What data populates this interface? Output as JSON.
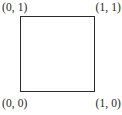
{
  "figure": {
    "type": "unit-square-diagram",
    "background_color": "#ffffff",
    "shape": {
      "name": "unit square",
      "stroke_color": "#2b2b2b",
      "fill_color": "#ffffff",
      "stroke_width_px": 1.5
    },
    "labels": {
      "top_left": "(0, 1)",
      "top_right": "(1, 1)",
      "bottom_left": "(0, 0)",
      "bottom_right": "(1, 0)"
    },
    "label_color": "#262626"
  },
  "chart_data": {
    "type": "scatter",
    "title": "",
    "xlabel": "",
    "ylabel": "",
    "xlim": [
      0,
      1
    ],
    "ylim": [
      0,
      1
    ],
    "grid": false,
    "legend": "none",
    "annotations": [
      {
        "text": "(0, 1)",
        "x": 0,
        "y": 1,
        "position": "above-left"
      },
      {
        "text": "(1, 1)",
        "x": 1,
        "y": 1,
        "position": "above-right"
      },
      {
        "text": "(0, 0)",
        "x": 0,
        "y": 0,
        "position": "below-left"
      },
      {
        "text": "(1, 0)",
        "x": 1,
        "y": 0,
        "position": "below-right"
      }
    ],
    "series": [
      {
        "name": "unit square outline",
        "x": [
          0,
          1,
          1,
          0,
          0
        ],
        "y": [
          0,
          0,
          1,
          1,
          0
        ]
      }
    ]
  }
}
